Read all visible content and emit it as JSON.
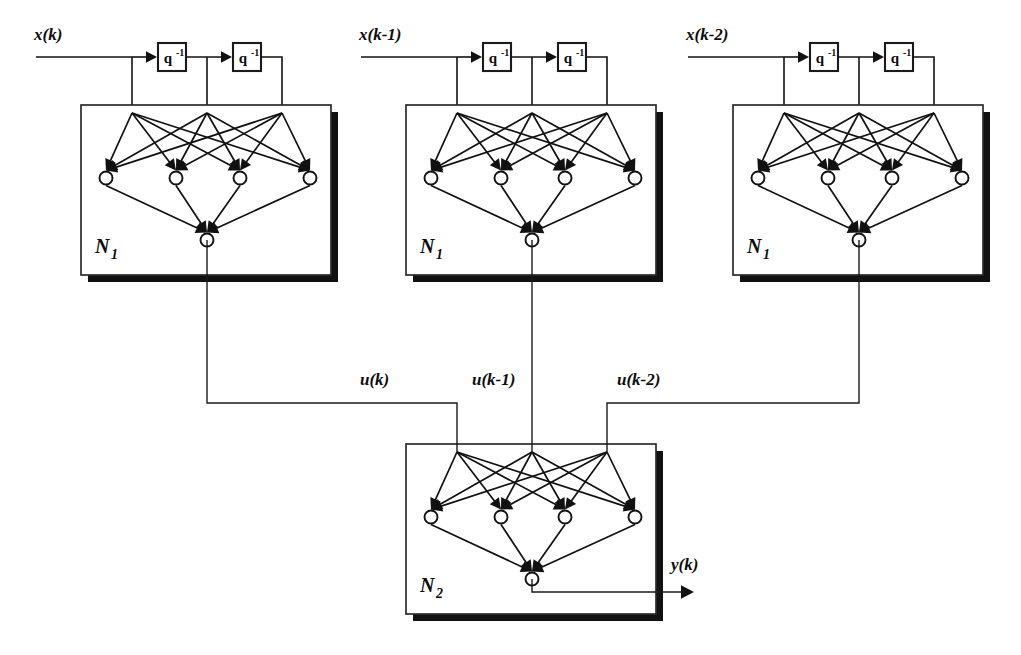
{
  "figure": {
    "type": "block-diagram",
    "background_color": "#ffffff",
    "line_color": "#111111",
    "shadow_color": "#111111"
  },
  "delay_operator": {
    "base": "q",
    "exponent": "-1",
    "full": "q-1"
  },
  "stages": [
    {
      "id": "stage-1",
      "input_label": "x(k)",
      "network_label": "N",
      "network_subscript": "1",
      "output_label": "u(k)",
      "delay_blocks": [
        "q-1",
        "q-1"
      ],
      "input_nodes": 3,
      "hidden_nodes": 4,
      "output_nodes": 1
    },
    {
      "id": "stage-2",
      "input_label": "x(k-1)",
      "network_label": "N",
      "network_subscript": "1",
      "output_label": "u(k-1)",
      "delay_blocks": [
        "q-1",
        "q-1"
      ],
      "input_nodes": 3,
      "hidden_nodes": 4,
      "output_nodes": 1
    },
    {
      "id": "stage-3",
      "input_label": "x(k-2)",
      "network_label": "N",
      "network_subscript": "1",
      "output_label": "u(k-2)",
      "delay_blocks": [
        "q-1",
        "q-1"
      ],
      "input_nodes": 3,
      "hidden_nodes": 4,
      "output_nodes": 1
    }
  ],
  "output_network": {
    "id": "stage-out",
    "network_label": "N",
    "network_subscript": "2",
    "output_label": "y(k)",
    "input_nodes": 3,
    "hidden_nodes": 4,
    "output_nodes": 1
  }
}
